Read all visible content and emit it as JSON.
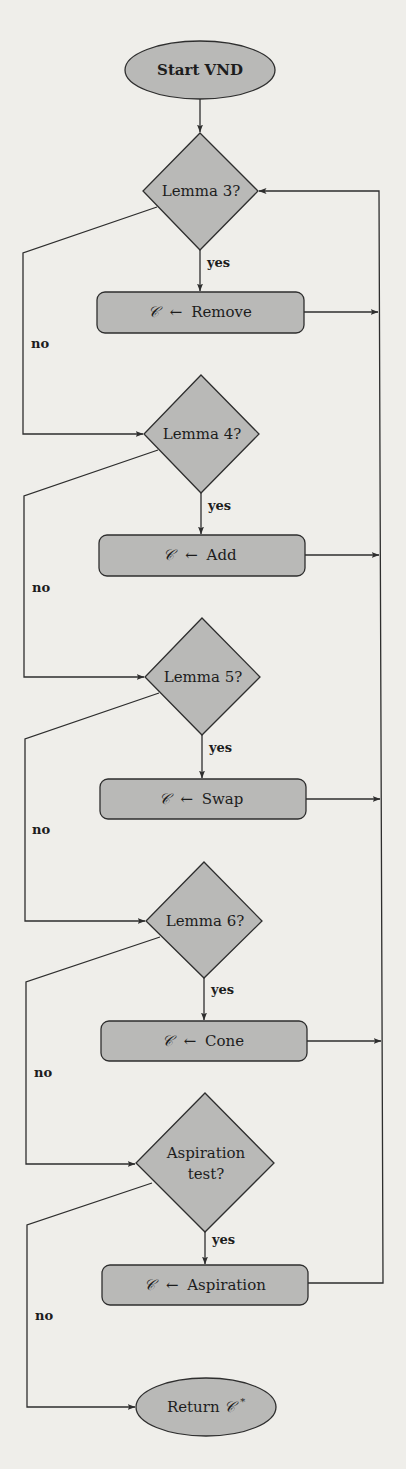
{
  "flowchart": {
    "title": "VND flowchart",
    "colors": {
      "background": "#efeeea",
      "node_fill": "#b9b9b7",
      "stroke": "#2e2e2e",
      "text": "#1d1d1d"
    },
    "start": {
      "id": "start",
      "shape": "ellipse",
      "label": "Start VND"
    },
    "decisions": [
      {
        "id": "lemma3",
        "shape": "diamond",
        "label": "Lemma 3?"
      },
      {
        "id": "lemma4",
        "shape": "diamond",
        "label": "Lemma 4?"
      },
      {
        "id": "lemma5",
        "shape": "diamond",
        "label": "Lemma 5?"
      },
      {
        "id": "lemma6",
        "shape": "diamond",
        "label": "Lemma 6?"
      },
      {
        "id": "aspiration_test",
        "shape": "diamond",
        "label_lines": [
          "Aspiration",
          "test?"
        ]
      }
    ],
    "actions": [
      {
        "id": "remove",
        "shape": "rounded-rect",
        "symbol": "𝒞",
        "arrow": "←",
        "op": "Remove"
      },
      {
        "id": "add",
        "shape": "rounded-rect",
        "symbol": "𝒞",
        "arrow": "←",
        "op": "Add"
      },
      {
        "id": "swap",
        "shape": "rounded-rect",
        "symbol": "𝒞",
        "arrow": "←",
        "op": "Swap"
      },
      {
        "id": "cone",
        "shape": "rounded-rect",
        "symbol": "𝒞",
        "arrow": "←",
        "op": "Cone"
      },
      {
        "id": "aspiration",
        "shape": "rounded-rect",
        "symbol": "𝒞",
        "arrow": "←",
        "op": "Aspiration"
      }
    ],
    "end": {
      "id": "end",
      "shape": "ellipse",
      "label_prefix": "Return ",
      "symbol": "𝒞",
      "superscript": "*"
    },
    "edge_labels": {
      "yes": "yes",
      "no": "no"
    },
    "edges": [
      {
        "from": "start",
        "to": "lemma3",
        "label": ""
      },
      {
        "from": "lemma3",
        "to": "remove",
        "label": "yes"
      },
      {
        "from": "lemma3",
        "to": "lemma4",
        "label": "no"
      },
      {
        "from": "lemma4",
        "to": "add",
        "label": "yes"
      },
      {
        "from": "lemma4",
        "to": "lemma5",
        "label": "no"
      },
      {
        "from": "lemma5",
        "to": "swap",
        "label": "yes"
      },
      {
        "from": "lemma5",
        "to": "lemma6",
        "label": "no"
      },
      {
        "from": "lemma6",
        "to": "cone",
        "label": "yes"
      },
      {
        "from": "lemma6",
        "to": "aspiration_test",
        "label": "no"
      },
      {
        "from": "aspiration_test",
        "to": "aspiration",
        "label": "yes"
      },
      {
        "from": "aspiration_test",
        "to": "end",
        "label": "no"
      },
      {
        "from": "remove",
        "to": "lemma3",
        "label": ""
      },
      {
        "from": "add",
        "to": "lemma3",
        "label": ""
      },
      {
        "from": "swap",
        "to": "lemma3",
        "label": ""
      },
      {
        "from": "cone",
        "to": "lemma3",
        "label": ""
      },
      {
        "from": "aspiration",
        "to": "lemma3",
        "label": ""
      }
    ]
  }
}
